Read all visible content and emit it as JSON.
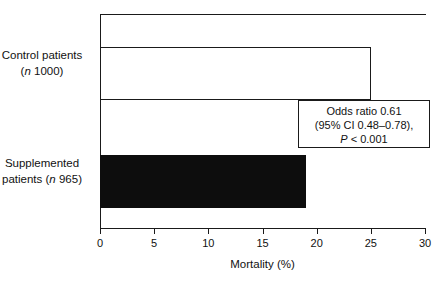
{
  "chart_data": {
    "type": "bar",
    "orientation": "horizontal",
    "title": "",
    "xlabel": "Mortality (%)",
    "ylabel": "",
    "xlim": [
      0,
      30
    ],
    "xticks": [
      0,
      5,
      10,
      15,
      20,
      25,
      30
    ],
    "xtick_labels": [
      "0",
      "5",
      "10",
      "15",
      "20",
      "25",
      "30"
    ],
    "grid": false,
    "legend": null,
    "categories": [
      "Control patients (n 1000)",
      "Supplemented patients (n 965)"
    ],
    "values": [
      25.0,
      19.0
    ],
    "bars": [
      {
        "category_line1": "Control patients",
        "category_line2_prefix": "(",
        "category_line2_italic": "n",
        "category_line2_suffix": " 1000)",
        "value": 25.0,
        "fill": "#ffffff",
        "stroke": "#1a1a1a"
      },
      {
        "category_line1": "Supplemented",
        "category_line2_prefix": "patients (",
        "category_line2_italic": "n",
        "category_line2_suffix": " 965)",
        "value": 19.0,
        "fill": "#0d0d0d",
        "stroke": "#0d0d0d"
      }
    ],
    "annotations": [
      {
        "line1": "Odds ratio 0.61",
        "line2": "(95% CI 0.48–0.78),",
        "line3_italic": "P",
        "line3_rest": " < 0.001"
      }
    ]
  },
  "colors": {
    "axis": "#1a1a1a",
    "text": "#111111",
    "bar_filled": "#0d0d0d",
    "bar_open": "#ffffff",
    "background": "#ffffff"
  }
}
